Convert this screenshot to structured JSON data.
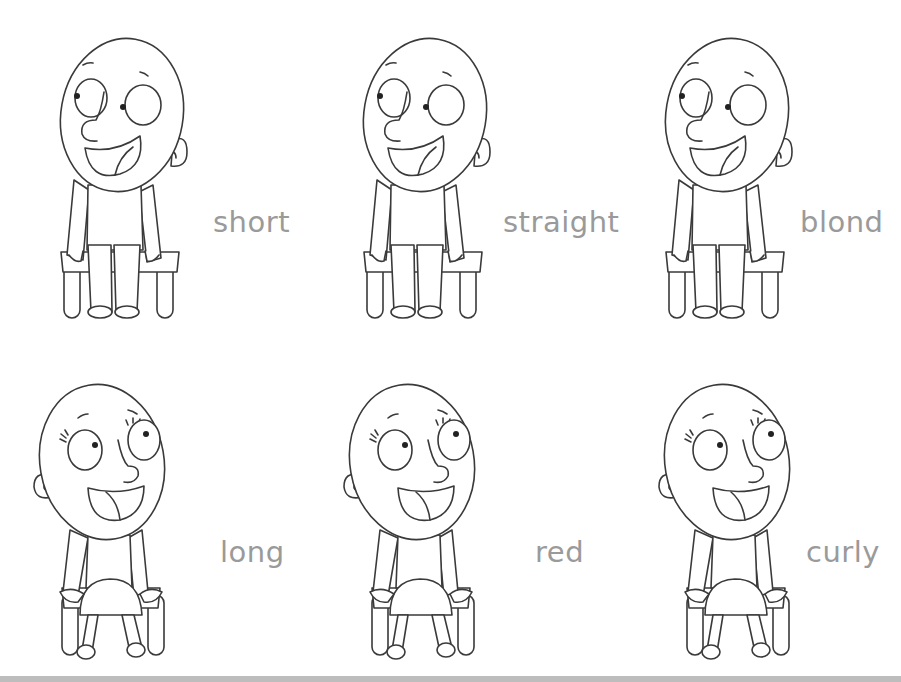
{
  "worksheet": {
    "cards": [
      {
        "character": "boy",
        "label": "short",
        "label_pos": {
          "x": 213,
          "y": 205
        },
        "fig_pos": {
          "x": 55,
          "y": 30
        }
      },
      {
        "character": "boy",
        "label": "straight",
        "label_pos": {
          "x": 503,
          "y": 205
        },
        "fig_pos": {
          "x": 358,
          "y": 30
        }
      },
      {
        "character": "boy",
        "label": "blond",
        "label_pos": {
          "x": 800,
          "y": 205
        },
        "fig_pos": {
          "x": 660,
          "y": 30
        }
      },
      {
        "character": "girl",
        "label": "long",
        "label_pos": {
          "x": 220,
          "y": 535
        },
        "fig_pos": {
          "x": 30,
          "y": 370
        }
      },
      {
        "character": "girl",
        "label": "red",
        "label_pos": {
          "x": 535,
          "y": 535
        },
        "fig_pos": {
          "x": 340,
          "y": 370
        }
      },
      {
        "character": "girl",
        "label": "curly",
        "label_pos": {
          "x": 806,
          "y": 535
        },
        "fig_pos": {
          "x": 655,
          "y": 370
        }
      }
    ],
    "colors": {
      "label": "#9a9a9a",
      "outline": "#3a3a3a",
      "bottom_bar": "#bdbdbd"
    }
  }
}
